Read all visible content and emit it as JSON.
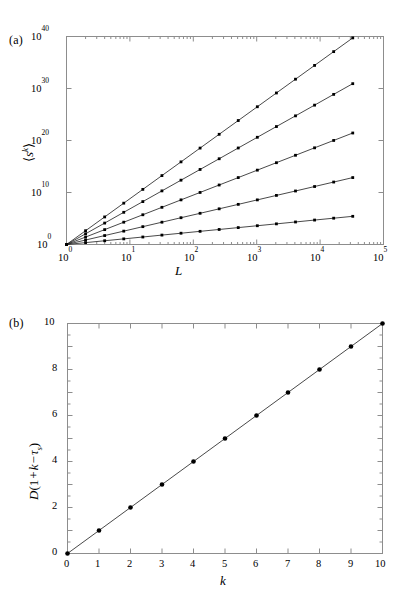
{
  "figure": {
    "panels": [
      {
        "id": "a",
        "label": "(a)",
        "xlabel": "L",
        "ylabel": "⟨sᵏ⟩",
        "xticks": [
          "10⁰",
          "10¹",
          "10²",
          "10³",
          "10⁴",
          "10⁵"
        ],
        "yticks": [
          "10⁰",
          "10¹⁰",
          "10²⁰",
          "10³⁰",
          "10⁴⁰"
        ]
      },
      {
        "id": "b",
        "label": "(b)",
        "xlabel": "k",
        "ylabel": "D(1 + k − τₛ)",
        "xticks": [
          "0",
          "1",
          "2",
          "3",
          "4",
          "5",
          "6",
          "7",
          "8",
          "9",
          "10"
        ],
        "yticks": [
          "0",
          "2",
          "4",
          "6",
          "8",
          "10"
        ]
      }
    ]
  },
  "chart_data": [
    {
      "type": "line",
      "panel": "a",
      "title": "",
      "xlabel": "L",
      "ylabel": "<s^k>",
      "xscale": "log10",
      "yscale": "log10",
      "xlim": [
        1,
        100000
      ],
      "ylim": [
        1,
        1e+40
      ],
      "xtick_values": [
        1,
        10,
        100,
        1000,
        10000,
        100000
      ],
      "xtick_labels": [
        "10^0",
        "10^1",
        "10^2",
        "10^3",
        "10^4",
        "10^5"
      ],
      "ytick_values": [
        1,
        10000000000.0,
        1e+20,
        1e+30,
        1e+40
      ],
      "ytick_labels": [
        "10^0",
        "10^10",
        "10^20",
        "10^30",
        "10^40"
      ],
      "grid": false,
      "legend": false,
      "notes": "Five power-law moment curves <s^k> vs L, all passing through (1,1); markers at L = 2^n for n = 0..15 (L up to ~3.3e4). Values given as log10(<s^k>).",
      "series": [
        {
          "name": "k = 8 (slope 8.8)",
          "slope_log10": 8.8,
          "x_log10": [
            0.0,
            0.301,
            0.602,
            0.903,
            1.204,
            1.505,
            1.806,
            2.107,
            2.408,
            2.709,
            3.01,
            3.311,
            3.612,
            3.913,
            4.214,
            4.515
          ],
          "y_log10": [
            0.0,
            2.65,
            5.3,
            7.95,
            10.6,
            13.25,
            15.89,
            18.54,
            21.19,
            23.84,
            26.49,
            29.14,
            31.79,
            34.44,
            37.09,
            39.73
          ]
        },
        {
          "name": "k = 6 (slope 6.85)",
          "slope_log10": 6.85,
          "x_log10": [
            0.0,
            0.301,
            0.602,
            0.903,
            1.204,
            1.505,
            1.806,
            2.107,
            2.408,
            2.709,
            3.01,
            3.311,
            3.612,
            3.913,
            4.214,
            4.515
          ],
          "y_log10": [
            0.0,
            2.06,
            4.12,
            6.19,
            8.25,
            10.31,
            12.37,
            14.43,
            16.49,
            18.56,
            20.62,
            22.68,
            24.74,
            26.8,
            28.87,
            30.93
          ]
        },
        {
          "name": "k = 4 (slope 4.75)",
          "slope_log10": 4.75,
          "x_log10": [
            0.0,
            0.301,
            0.602,
            0.903,
            1.204,
            1.505,
            1.806,
            2.107,
            2.408,
            2.709,
            3.01,
            3.311,
            3.612,
            3.913,
            4.214,
            4.515
          ],
          "y_log10": [
            0.0,
            1.43,
            2.86,
            4.29,
            5.72,
            7.15,
            8.58,
            10.01,
            11.44,
            12.87,
            14.3,
            15.73,
            17.16,
            18.59,
            20.01,
            21.44
          ]
        },
        {
          "name": "k = 2 (slope 2.85)",
          "slope_log10": 2.85,
          "x_log10": [
            0.0,
            0.301,
            0.602,
            0.903,
            1.204,
            1.505,
            1.806,
            2.107,
            2.408,
            2.709,
            3.01,
            3.311,
            3.612,
            3.913,
            4.214,
            4.515
          ],
          "y_log10": [
            0.0,
            0.86,
            1.72,
            2.57,
            3.43,
            4.29,
            5.15,
            6.0,
            6.86,
            7.72,
            8.58,
            9.44,
            10.29,
            11.15,
            12.01,
            12.87
          ]
        },
        {
          "name": "k = 1 (slope 1.20)",
          "slope_log10": 1.2,
          "x_log10": [
            0.0,
            0.301,
            0.602,
            0.903,
            1.204,
            1.505,
            1.806,
            2.107,
            2.408,
            2.709,
            3.01,
            3.311,
            3.612,
            3.913,
            4.214,
            4.515
          ],
          "y_log10": [
            0.0,
            0.36,
            0.72,
            1.08,
            1.44,
            1.81,
            2.17,
            2.53,
            2.89,
            3.25,
            3.61,
            3.97,
            4.33,
            4.7,
            5.06,
            5.42
          ]
        }
      ]
    },
    {
      "type": "scatter",
      "panel": "b",
      "title": "",
      "xlabel": "k",
      "ylabel": "D(1 + k - tau_s)",
      "xscale": "linear",
      "yscale": "linear",
      "xlim": [
        0,
        10
      ],
      "ylim": [
        0,
        10
      ],
      "xtick_values": [
        0,
        1,
        2,
        3,
        4,
        5,
        6,
        7,
        8,
        9,
        10
      ],
      "ytick_values": [
        0,
        2,
        4,
        6,
        8,
        10
      ],
      "grid": false,
      "legend": false,
      "notes": "Data points fall on the straight line y = x (unit slope through origin).",
      "series": [
        {
          "name": "D(1+k-tau_s)",
          "x": [
            0,
            1,
            2,
            3,
            4,
            5,
            6,
            7,
            8,
            9,
            10
          ],
          "y": [
            0,
            1,
            2,
            3,
            4,
            5,
            6,
            7,
            8,
            9,
            10
          ]
        }
      ],
      "fit_line": {
        "slope": 1.0,
        "intercept": 0.0
      }
    }
  ],
  "colors": {
    "frame": "#8d8d8d",
    "curve": "#1a1a1a",
    "marker": "#000000",
    "background": "#ffffff"
  }
}
